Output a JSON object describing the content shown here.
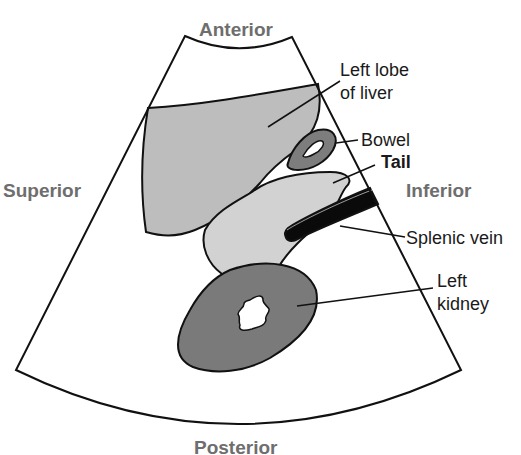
{
  "diagram": {
    "type": "ultrasound-sector-sketch",
    "orientation": {
      "top": "Anterior",
      "bottom": "Posterior",
      "left": "Superior",
      "right": "Inferior"
    },
    "labels": {
      "liver_line1": "Left lobe",
      "liver_line2": "of liver",
      "bowel": "Bowel",
      "tail": "Tail",
      "splenic_vein": "Splenic vein",
      "kidney_line1": "Left",
      "kidney_line2": "kidney"
    },
    "colors": {
      "liver": "#bdbdbd",
      "pancreas_tail": "#d2d2d2",
      "bowel": "#7d7d7d",
      "kidney": "#7a7a7a",
      "splenic_vein": "#0a0a0a",
      "orientation_text": "#6e6e6e",
      "outline": "#111111"
    }
  }
}
